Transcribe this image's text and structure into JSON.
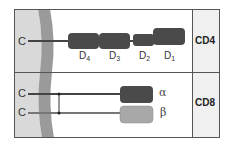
{
  "diagram": {
    "type": "molecular-structure",
    "colors": {
      "membrane_outer": "#d9d9d9",
      "membrane_inner": "#9a9a9a",
      "domain_dark": "#4a4a4a",
      "domain_light": "#a8a8a8",
      "label_column": "#f0f0f0",
      "border": "#555555"
    },
    "rows": [
      {
        "name": "CD4",
        "label": "CD4",
        "terminus_label": "C",
        "domains": [
          {
            "label_main": "D",
            "label_sub": "4"
          },
          {
            "label_main": "D",
            "label_sub": "3"
          },
          {
            "label_main": "D",
            "label_sub": "2"
          },
          {
            "label_main": "D",
            "label_sub": "1"
          }
        ]
      },
      {
        "name": "CD8",
        "label": "CD8",
        "chains": [
          {
            "terminus_label": "C",
            "chain_label": "α"
          },
          {
            "terminus_label": "C",
            "chain_label": "β"
          }
        ]
      }
    ]
  }
}
